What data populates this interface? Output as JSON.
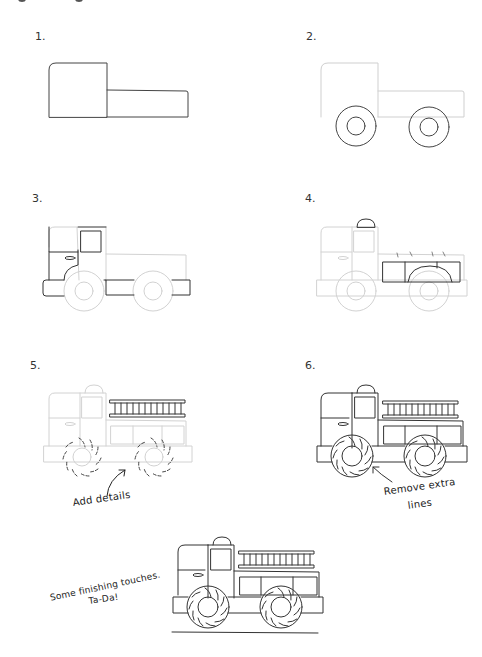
{
  "page": {
    "background": "#ffffff",
    "line_color_dark": "#333333",
    "line_color_faint": "#c8c8c8"
  },
  "steps": [
    {
      "number": "1.",
      "description": "Cab and truck bed outline"
    },
    {
      "number": "2.",
      "description": "Add two wheels"
    },
    {
      "number": "3.",
      "description": "Window, door handle, wheel arch and bumper"
    },
    {
      "number": "4.",
      "description": "Siren light and rear compartments"
    },
    {
      "number": "5.",
      "description": "Ladder and tire treads",
      "annotation": "Add details"
    },
    {
      "number": "6.",
      "description": "Cleaned-up truck",
      "annotation_line1": "Remove extra",
      "annotation_line2": "lines"
    },
    {
      "number": "",
      "description": "Final drawing with ground line",
      "annotation_line1": "Some finishing touches.",
      "annotation_line2": "Ta-Da!"
    }
  ]
}
